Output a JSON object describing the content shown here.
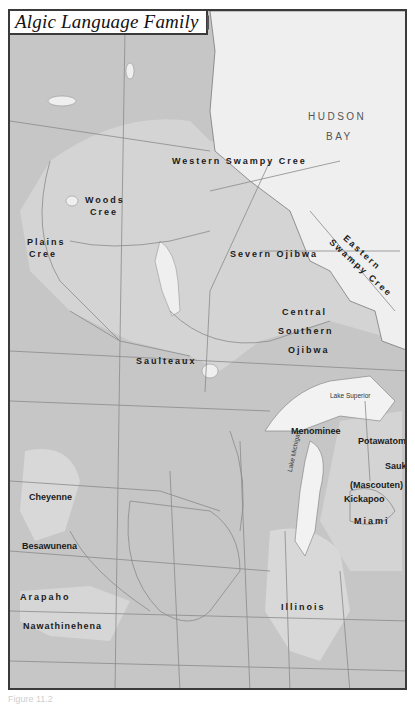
{
  "title": "Algic Language Family",
  "legend": {
    "swatch_color": "#d0d0d0",
    "label": "Algic Language Family"
  },
  "water_bodies": {
    "hudson_bay": [
      "HUDSON",
      "BAY"
    ],
    "lake_superior": "Lake Superior",
    "lake_michigan": "Lake Michigan"
  },
  "languages": {
    "western_swampy_cree": "Western Swampy Cree",
    "woods_cree_1": "Woods",
    "woods_cree_2": "Cree",
    "plains_cree_1": "Plains",
    "plains_cree_2": "Cree",
    "eastern_swampy_cree_1": "Eastern",
    "eastern_swampy_cree_2": "Swampy Cree",
    "severn_ojibwa": "Severn Ojibwa",
    "central_southern_ojibwa_1": "Central",
    "central_southern_ojibwa_2": "Southern",
    "central_southern_ojibwa_3": "Ojibwa",
    "saulteaux": "Saulteaux",
    "menominee": "Menominee",
    "potawatomi": "Potawatomi",
    "sauk": "Sauk",
    "mascouten": "(Mascouten)",
    "kickapoo": "Kickapoo",
    "miami": "Miami",
    "illinois": "Illinois",
    "cheyenne": "Cheyenne",
    "besawunena": "Besawunena",
    "arapaho": "Arapaho",
    "nawathinehena": "Nawathinehena"
  },
  "colors": {
    "land": "#c9c9c9",
    "algic_region": "#d6d6d6",
    "water": "#efefef",
    "border": "#3a3a3a",
    "lines": "#8a8a8a"
  },
  "caption": "Figure 11.2"
}
